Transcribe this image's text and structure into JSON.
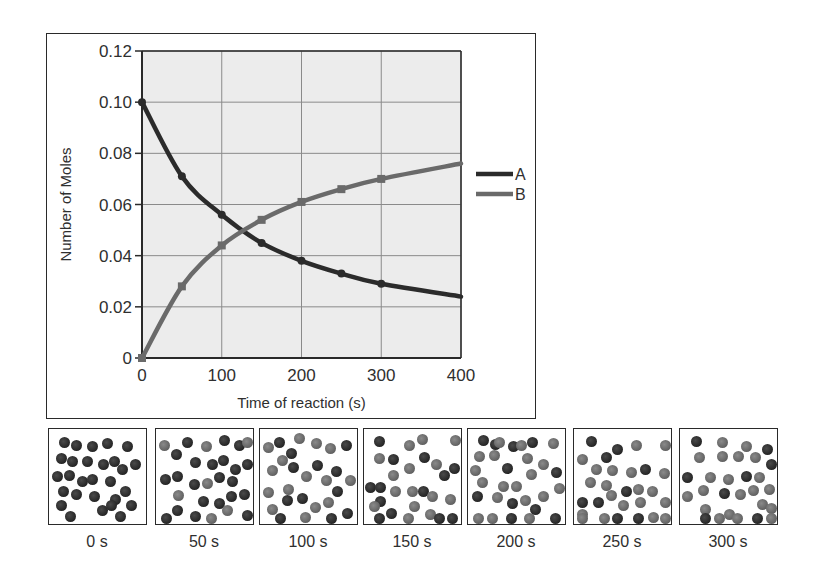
{
  "chart_data": {
    "type": "line",
    "title": "",
    "xlabel": "Time of reaction (s)",
    "ylabel": "Number of Moles",
    "xlim": [
      0,
      400
    ],
    "ylim": [
      0,
      0.12
    ],
    "x_ticks": [
      "0",
      "100",
      "200",
      "300",
      "400"
    ],
    "y_ticks": [
      "0",
      "0.02",
      "0.04",
      "0.06",
      "0.08",
      "0.10",
      "0.12"
    ],
    "grid": true,
    "legend_position": "right",
    "x": [
      0,
      50,
      100,
      150,
      200,
      250,
      300,
      400
    ],
    "series": [
      {
        "name": "A",
        "color": "#2b2b2b",
        "values": [
          0.1,
          0.071,
          0.056,
          0.045,
          0.038,
          0.033,
          0.029,
          0.024
        ]
      },
      {
        "name": "B",
        "color": "#6a6a6a",
        "values": [
          0.0,
          0.028,
          0.044,
          0.054,
          0.061,
          0.066,
          0.07,
          0.076
        ]
      }
    ],
    "marker_x": [
      0,
      50,
      100,
      150,
      200,
      250,
      300
    ]
  },
  "legend": {
    "items": [
      {
        "label": "A",
        "color": "#2b2b2b"
      },
      {
        "label": "B",
        "color": "#6a6a6a"
      }
    ]
  },
  "colors": {
    "plot_background": "#ececec",
    "grid": "#8a8a8a",
    "molecule_A": "#2b2b2b",
    "molecule_B": "#6e6e6e"
  },
  "snapshots": [
    {
      "label": "0 s",
      "molecules": [
        [
          "A",
          10,
          8
        ],
        [
          "A",
          22,
          11
        ],
        [
          "A",
          38,
          12
        ],
        [
          "A",
          53,
          9
        ],
        [
          "A",
          73,
          12
        ],
        [
          "A",
          7,
          24
        ],
        [
          "A",
          18,
          27
        ],
        [
          "A",
          33,
          27
        ],
        [
          "A",
          49,
          30
        ],
        [
          "A",
          60,
          27
        ],
        [
          "A",
          81,
          30
        ],
        [
          "A",
          68,
          35
        ],
        [
          "A",
          3,
          42
        ],
        [
          "A",
          15,
          41
        ],
        [
          "A",
          28,
          47
        ],
        [
          "A",
          38,
          45
        ],
        [
          "A",
          56,
          47
        ],
        [
          "A",
          9,
          57
        ],
        [
          "A",
          22,
          60
        ],
        [
          "A",
          40,
          62
        ],
        [
          "A",
          71,
          57
        ],
        [
          "A",
          61,
          65
        ],
        [
          "A",
          7,
          71
        ],
        [
          "A",
          48,
          76
        ],
        [
          "A",
          77,
          71
        ],
        [
          "A",
          57,
          71
        ],
        [
          "A",
          16,
          82
        ],
        [
          "A",
          66,
          82
        ]
      ]
    },
    {
      "label": "50 s",
      "molecules": [
        [
          "B",
          3,
          11
        ],
        [
          "A",
          15,
          20
        ],
        [
          "A",
          26,
          8
        ],
        [
          "B",
          45,
          12
        ],
        [
          "A",
          63,
          6
        ],
        [
          "A",
          78,
          11
        ],
        [
          "B",
          88,
          8
        ],
        [
          "A",
          34,
          28
        ],
        [
          "A",
          51,
          30
        ],
        [
          "A",
          62,
          26
        ],
        [
          "A",
          74,
          35
        ],
        [
          "A",
          87,
          30
        ],
        [
          "A",
          58,
          43
        ],
        [
          "A",
          71,
          47
        ],
        [
          "A",
          4,
          45
        ],
        [
          "A",
          16,
          42
        ],
        [
          "A",
          33,
          50
        ],
        [
          "B",
          46,
          49
        ],
        [
          "B",
          17,
          61
        ],
        [
          "A",
          42,
          67
        ],
        [
          "A",
          58,
          69
        ],
        [
          "A",
          70,
          62
        ],
        [
          "A",
          83,
          60
        ],
        [
          "A",
          16,
          76
        ],
        [
          "A",
          34,
          82
        ],
        [
          "B",
          66,
          76
        ],
        [
          "A",
          86,
          81
        ],
        [
          "A",
          5,
          86
        ],
        [
          "B",
          50,
          91
        ]
      ]
    },
    {
      "label": "100 s",
      "molecules": [
        [
          "B",
          3,
          13
        ],
        [
          "A",
          14,
          8
        ],
        [
          "B",
          34,
          4
        ],
        [
          "A",
          26,
          19
        ],
        [
          "B",
          51,
          9
        ],
        [
          "B",
          65,
          14
        ],
        [
          "A",
          81,
          11
        ],
        [
          "B",
          17,
          26
        ],
        [
          "A",
          28,
          33
        ],
        [
          "A",
          52,
          31
        ],
        [
          "B",
          7,
          36
        ],
        [
          "A",
          71,
          37
        ],
        [
          "B",
          41,
          42
        ],
        [
          "B",
          61,
          46
        ],
        [
          "B",
          85,
          46
        ],
        [
          "B",
          3,
          58
        ],
        [
          "B",
          23,
          55
        ],
        [
          "A",
          72,
          57
        ],
        [
          "A",
          22,
          66
        ],
        [
          "A",
          37,
          64
        ],
        [
          "B",
          63,
          68
        ],
        [
          "B",
          50,
          73
        ],
        [
          "B",
          7,
          75
        ],
        [
          "A",
          82,
          79
        ],
        [
          "B",
          40,
          83
        ],
        [
          "A",
          15,
          85
        ],
        [
          "A",
          66,
          87
        ]
      ]
    },
    {
      "label": "150 s",
      "molecules": [
        [
          "A",
          10,
          7
        ],
        [
          "B",
          40,
          11
        ],
        [
          "B",
          53,
          5
        ],
        [
          "B",
          87,
          6
        ],
        [
          "B",
          10,
          24
        ],
        [
          "A",
          24,
          25
        ],
        [
          "A",
          55,
          23
        ],
        [
          "B",
          40,
          34
        ],
        [
          "B",
          67,
          30
        ],
        [
          "A",
          75,
          41
        ],
        [
          "A",
          85,
          34
        ],
        [
          "B",
          24,
          41
        ],
        [
          "A",
          -2,
          53
        ],
        [
          "A",
          11,
          53
        ],
        [
          "B",
          26,
          57
        ],
        [
          "B",
          43,
          57
        ],
        [
          "A",
          54,
          57
        ],
        [
          "B",
          63,
          62
        ],
        [
          "B",
          81,
          65
        ],
        [
          "A",
          11,
          67
        ],
        [
          "B",
          5,
          72
        ],
        [
          "A",
          22,
          79
        ],
        [
          "B",
          45,
          72
        ],
        [
          "B",
          61,
          80
        ],
        [
          "B",
          39,
          87
        ],
        [
          "A",
          83,
          88
        ],
        [
          "A",
          10,
          90
        ],
        [
          "A",
          70,
          89
        ]
      ]
    },
    {
      "label": "200 s",
      "molecules": [
        [
          "A",
          10,
          6
        ],
        [
          "A",
          22,
          10
        ],
        [
          "B",
          26,
          8
        ],
        [
          "A",
          40,
          12
        ],
        [
          "B",
          48,
          11
        ],
        [
          "A",
          59,
          8
        ],
        [
          "B",
          80,
          9
        ],
        [
          "B",
          6,
          22
        ],
        [
          "B",
          21,
          21
        ],
        [
          "B",
          54,
          24
        ],
        [
          "B",
          70,
          30
        ],
        [
          "A",
          34,
          34
        ],
        [
          "B",
          2,
          36
        ],
        [
          "B",
          58,
          40
        ],
        [
          "A",
          83,
          38
        ],
        [
          "B",
          9,
          48
        ],
        [
          "B",
          30,
          52
        ],
        [
          "B",
          43,
          52
        ],
        [
          "A",
          4,
          62
        ],
        [
          "B",
          24,
          63
        ],
        [
          "A",
          39,
          69
        ],
        [
          "B",
          52,
          66
        ],
        [
          "B",
          70,
          62
        ],
        [
          "B",
          88,
          54
        ],
        [
          "A",
          62,
          75
        ],
        [
          "B",
          5,
          84
        ],
        [
          "B",
          19,
          84
        ],
        [
          "A",
          38,
          84
        ],
        [
          "B",
          56,
          84
        ],
        [
          "A",
          82,
          84
        ]
      ]
    },
    {
      "label": "250 s",
      "molecules": [
        [
          "A",
          12,
          7
        ],
        [
          "A",
          38,
          15
        ],
        [
          "B",
          57,
          11
        ],
        [
          "B",
          88,
          11
        ],
        [
          "A",
          27,
          23
        ],
        [
          "B",
          3,
          25
        ],
        [
          "B",
          17,
          35
        ],
        [
          "B",
          33,
          36
        ],
        [
          "B",
          52,
          38
        ],
        [
          "A",
          66,
          35
        ],
        [
          "B",
          85,
          39
        ],
        [
          "B",
          11,
          48
        ],
        [
          "B",
          27,
          51
        ],
        [
          "A",
          47,
          57
        ],
        [
          "B",
          59,
          55
        ],
        [
          "B",
          73,
          57
        ],
        [
          "B",
          32,
          61
        ],
        [
          "A",
          3,
          68
        ],
        [
          "A",
          19,
          68
        ],
        [
          "B",
          61,
          68
        ],
        [
          "B",
          87,
          68
        ],
        [
          "B",
          44,
          71
        ],
        [
          "B",
          3,
          80
        ],
        [
          "B",
          25,
          85
        ],
        [
          "A",
          38,
          88
        ],
        [
          "B",
          74,
          83
        ],
        [
          "B",
          3,
          92
        ],
        [
          "A",
          59,
          95
        ],
        [
          "B",
          86,
          91
        ]
      ]
    },
    {
      "label": "300 s",
      "molecules": [
        [
          "A",
          11,
          7
        ],
        [
          "B",
          37,
          8
        ],
        [
          "B",
          61,
          12
        ],
        [
          "A",
          82,
          15
        ],
        [
          "B",
          14,
          23
        ],
        [
          "B",
          37,
          22
        ],
        [
          "B",
          53,
          22
        ],
        [
          "B",
          70,
          23
        ],
        [
          "A",
          89,
          30
        ],
        [
          "A",
          2,
          43
        ],
        [
          "B",
          25,
          43
        ],
        [
          "B",
          43,
          45
        ],
        [
          "A",
          61,
          42
        ],
        [
          "B",
          74,
          43
        ],
        [
          "B",
          18,
          56
        ],
        [
          "A",
          39,
          59
        ],
        [
          "B",
          55,
          60
        ],
        [
          "B",
          68,
          56
        ],
        [
          "B",
          84,
          55
        ],
        [
          "B",
          2,
          62
        ],
        [
          "B",
          77,
          70
        ],
        [
          "B",
          94,
          74
        ],
        [
          "B",
          20,
          75
        ],
        [
          "B",
          44,
          80
        ],
        [
          "A",
          20,
          88
        ],
        [
          "B",
          34,
          92
        ],
        [
          "B",
          52,
          96
        ],
        [
          "A",
          72,
          92
        ],
        [
          "B",
          92,
          91
        ]
      ]
    }
  ]
}
